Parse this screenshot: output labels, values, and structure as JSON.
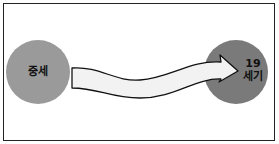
{
  "diagram": {
    "start_node": {
      "label": "중세",
      "color": "#9a9a9a"
    },
    "end_node": {
      "line1": "19",
      "line2": "세기",
      "color": "#7a7a7a"
    },
    "arrow": {
      "fill": "#f2f2f2",
      "stroke": "#111111",
      "direction": "left-to-right"
    }
  }
}
